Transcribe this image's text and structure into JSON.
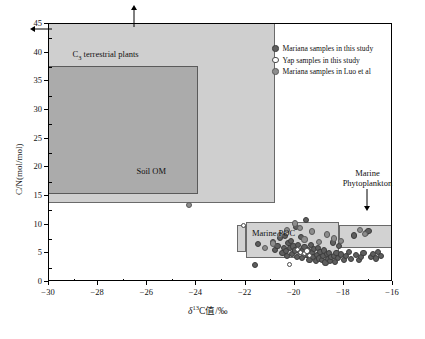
{
  "chart_data": {
    "type": "scatter",
    "title": "",
    "xlabel": "δ¹³C值/‰",
    "xlabel_parts": {
      "delta": "δ",
      "sup": "13",
      "rest": "C值/‰"
    },
    "ylabel": "C/N(mol/mol)",
    "xlim": [
      -30,
      -16
    ],
    "ylim": [
      0,
      45
    ],
    "xticks": [
      -30,
      -28,
      -26,
      -24,
      -22,
      -20,
      -18,
      -16
    ],
    "xticklabels": [
      "−30",
      "−28",
      "−26",
      "−24",
      "−22",
      "−20",
      "−18",
      "−16"
    ],
    "yticks": [
      0,
      5,
      10,
      15,
      20,
      25,
      30,
      35,
      40,
      45
    ],
    "yticklabels": [
      "0",
      "5",
      "10",
      "15",
      "20",
      "25",
      "30",
      "35",
      "40",
      "45"
    ],
    "grid": false,
    "legend_position": "upper right",
    "series": [
      {
        "name": "Mariana samples in this study",
        "marker": "filled-circle",
        "color": "#5e5e5e",
        "points": [
          [
            -21.6,
            3.0
          ],
          [
            -21.5,
            6.6
          ],
          [
            -20.9,
            7.0
          ],
          [
            -20.8,
            5.6
          ],
          [
            -20.7,
            6.3
          ],
          [
            -20.6,
            7.7
          ],
          [
            -20.5,
            5.1
          ],
          [
            -20.45,
            6.0
          ],
          [
            -20.4,
            8.0
          ],
          [
            -20.35,
            5.4
          ],
          [
            -20.3,
            4.6
          ],
          [
            -20.25,
            6.8
          ],
          [
            -20.2,
            5.9
          ],
          [
            -20.15,
            7.2
          ],
          [
            -20.1,
            4.9
          ],
          [
            -20.05,
            6.2
          ],
          [
            -20.0,
            5.5
          ],
          [
            -19.95,
            9.6
          ],
          [
            -19.9,
            4.4
          ],
          [
            -19.85,
            6.5
          ],
          [
            -19.8,
            5.2
          ],
          [
            -19.75,
            7.9
          ],
          [
            -19.7,
            4.2
          ],
          [
            -19.65,
            5.8
          ],
          [
            -19.6,
            6.1
          ],
          [
            -19.55,
            10.8
          ],
          [
            -19.5,
            4.8
          ],
          [
            -19.45,
            5.6
          ],
          [
            -19.4,
            3.9
          ],
          [
            -19.35,
            6.4
          ],
          [
            -19.3,
            5.0
          ],
          [
            -19.25,
            4.3
          ],
          [
            -19.2,
            5.7
          ],
          [
            -19.15,
            3.6
          ],
          [
            -19.1,
            4.7
          ],
          [
            -19.05,
            6.0
          ],
          [
            -19.0,
            4.1
          ],
          [
            -18.95,
            5.3
          ],
          [
            -18.9,
            3.8
          ],
          [
            -18.85,
            4.5
          ],
          [
            -18.8,
            5.5
          ],
          [
            -18.75,
            3.4
          ],
          [
            -18.7,
            4.9
          ],
          [
            -18.65,
            4.0
          ],
          [
            -18.6,
            5.1
          ],
          [
            -18.55,
            3.7
          ],
          [
            -18.5,
            4.4
          ],
          [
            -18.45,
            6.9
          ],
          [
            -18.4,
            4.6
          ],
          [
            -18.35,
            3.5
          ],
          [
            -18.3,
            5.0
          ],
          [
            -18.25,
            4.2
          ],
          [
            -18.2,
            6.3
          ],
          [
            -18.1,
            4.8
          ],
          [
            -18.0,
            3.9
          ],
          [
            -17.9,
            4.5
          ],
          [
            -17.8,
            5.2
          ],
          [
            -17.7,
            4.0
          ],
          [
            -17.6,
            8.1
          ],
          [
            -17.5,
            4.7
          ],
          [
            -17.4,
            3.8
          ],
          [
            -17.3,
            4.3
          ],
          [
            -17.2,
            5.0
          ],
          [
            -17.1,
            8.6
          ],
          [
            -17.0,
            8.9
          ],
          [
            -16.9,
            4.4
          ],
          [
            -16.8,
            4.9
          ],
          [
            -16.7,
            4.1
          ],
          [
            -16.6,
            5.3
          ],
          [
            -16.5,
            4.6
          ]
        ]
      },
      {
        "name": "Yap samples in this study",
        "marker": "open-circle",
        "color": "#ffffff",
        "points": [
          [
            -22.1,
            9.8
          ],
          [
            -20.2,
            3.0
          ],
          [
            -19.9,
            5.6
          ],
          [
            -19.75,
            5.2
          ],
          [
            -19.6,
            4.9
          ],
          [
            -19.5,
            5.4
          ],
          [
            -19.4,
            4.6
          ]
        ]
      },
      {
        "name": "Mariana samples in Luo et al",
        "marker": "filled-circle-gray",
        "color": "#8d8d8d",
        "points": [
          [
            -24.3,
            13.5
          ],
          [
            -20.6,
            8.2
          ],
          [
            -20.3,
            9.1
          ],
          [
            -20.0,
            10.2
          ],
          [
            -19.8,
            9.4
          ],
          [
            -19.6,
            7.4
          ],
          [
            -19.3,
            8.8
          ],
          [
            -19.0,
            7.0
          ],
          [
            -18.7,
            8.3
          ],
          [
            -18.4,
            7.6
          ],
          [
            -17.35,
            9.0
          ],
          [
            -17.15,
            8.4
          ],
          [
            -21.2,
            5.9
          ],
          [
            -20.9,
            6.7
          ],
          [
            -18.1,
            7.2
          ]
        ]
      }
    ],
    "regions": [
      {
        "name": "C3 terrestrial plants",
        "label": "C₃ terrestrial plants",
        "label_main": "C",
        "label_sub": "3",
        "label_rest": " terrestrial plants",
        "x0": -30.6,
        "x1": -20.8,
        "y0": 13.7,
        "y1": 46.5,
        "fill": "#cfcfcf"
      },
      {
        "name": "Soil OM",
        "label": "Soil OM",
        "x0": -30.6,
        "x1": -23.95,
        "y0": 15.3,
        "y1": 37.7,
        "fill": "#ababab"
      },
      {
        "name": "Marine POC",
        "label": "Marine POC",
        "x0": -22.0,
        "x1": -18.2,
        "y0": 4.1,
        "y1": 10.5,
        "fill": "#d2d2d2"
      },
      {
        "name": "Marine Phytoplankton whisker",
        "label": "",
        "x0": -22.35,
        "x1": -22.0,
        "y0": 5.2,
        "y1": 9.9,
        "fill": "#d2d2d2"
      },
      {
        "name": "Marine Phytoplankton",
        "label": "Marine Phytoplankton",
        "x0": -18.2,
        "x1": -15.85,
        "y0": 6.0,
        "y1": 9.9,
        "fill": "#d2d2d2"
      }
    ],
    "annotations": [
      {
        "name": "phytoplankton-callout",
        "text_line1": "Marine",
        "text_line2": "Phytoplankton",
        "arrow": "down",
        "x": -17.0,
        "y": 12.0
      },
      {
        "name": "c3-up-arrow",
        "arrow": "up",
        "x": -26.5,
        "y": 46
      },
      {
        "name": "c3-left-arrow",
        "arrow": "left",
        "x": -30.3,
        "y": 44.0
      }
    ]
  },
  "legend": {
    "items": [
      {
        "label": "Mariana samples in this study",
        "marker": "filled-circle-dark"
      },
      {
        "label": "Yap samples in this study",
        "marker": "open-circle"
      },
      {
        "label": "Mariana samples in Luo et al",
        "marker": "filled-circle-gray"
      }
    ]
  }
}
